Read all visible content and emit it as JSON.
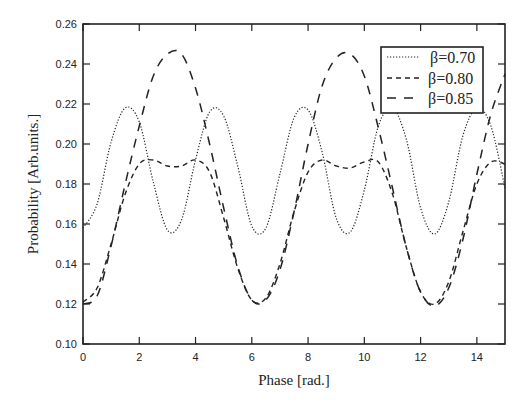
{
  "chart_data": {
    "type": "line",
    "title": "",
    "xlabel": "Phase [rad.]",
    "ylabel": "Probability [Arb.units.]",
    "xlim": [
      0,
      15
    ],
    "ylim": [
      0.1,
      0.26
    ],
    "x_ticks": [
      0,
      2,
      4,
      6,
      8,
      10,
      12,
      14
    ],
    "x_tick_labels": [
      "0",
      "2",
      "4",
      "6",
      "8",
      "10",
      "12",
      "14"
    ],
    "y_ticks": [
      0.1,
      0.12,
      0.14,
      0.16,
      0.18,
      0.2,
      0.22,
      0.24,
      0.26
    ],
    "y_tick_labels": [
      "0.10",
      "0.12",
      "0.14",
      "0.16",
      "0.18",
      "0.20",
      "0.22",
      "0.24",
      "0.26"
    ],
    "grid": false,
    "legend_position": "upper right",
    "x": [
      0.0,
      0.5,
      1.0,
      1.5,
      2.0,
      2.5,
      3.0,
      3.5,
      4.0,
      4.5,
      5.0,
      5.5,
      6.0,
      6.5,
      7.0,
      7.5,
      8.0,
      8.5,
      9.0,
      9.5,
      10.0,
      10.5,
      11.0,
      11.5,
      12.0,
      12.5,
      13.0,
      13.5,
      14.0,
      14.5,
      15.0
    ],
    "series": [
      {
        "name": "β=0.70",
        "style": "dotted",
        "values": [
          0.158,
          0.17,
          0.201,
          0.218,
          0.211,
          0.181,
          0.157,
          0.162,
          0.192,
          0.216,
          0.214,
          0.189,
          0.159,
          0.158,
          0.185,
          0.213,
          0.217,
          0.196,
          0.163,
          0.156,
          0.177,
          0.209,
          0.218,
          0.202,
          0.168,
          0.155,
          0.171,
          0.204,
          0.218,
          0.209,
          0.178
        ]
      },
      {
        "name": "β=0.80",
        "style": "dashed",
        "values": [
          0.121,
          0.128,
          0.15,
          0.175,
          0.19,
          0.192,
          0.189,
          0.189,
          0.192,
          0.186,
          0.163,
          0.138,
          0.122,
          0.123,
          0.14,
          0.166,
          0.186,
          0.192,
          0.189,
          0.188,
          0.191,
          0.191,
          0.175,
          0.148,
          0.126,
          0.12,
          0.131,
          0.156,
          0.18,
          0.191,
          0.19
        ]
      },
      {
        "name": "β=0.85",
        "style": "long-dashed",
        "values": [
          0.12,
          0.124,
          0.149,
          0.18,
          0.209,
          0.234,
          0.245,
          0.245,
          0.228,
          0.2,
          0.168,
          0.139,
          0.122,
          0.122,
          0.137,
          0.166,
          0.2,
          0.229,
          0.243,
          0.245,
          0.234,
          0.208,
          0.178,
          0.148,
          0.126,
          0.119,
          0.128,
          0.152,
          0.185,
          0.215,
          0.235
        ]
      }
    ]
  },
  "legend": {
    "items": [
      {
        "label": "β=0.70",
        "style": "dotted"
      },
      {
        "label": "β=0.80",
        "style": "dashed"
      },
      {
        "label": "β=0.85",
        "style": "long-dashed"
      }
    ]
  },
  "colors": {
    "line": "#222222",
    "axis": "#222222",
    "background": "#ffffff"
  }
}
